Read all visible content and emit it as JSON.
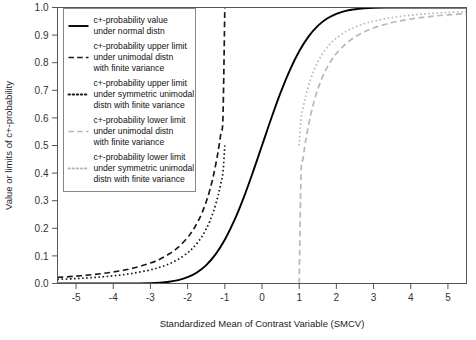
{
  "chart_data": {
    "type": "line",
    "title": "",
    "xlabel": "Standardized Mean of Contrast Variable (SMCV)",
    "ylabel": "Value or limits of c+-probability",
    "xlim": [
      -5.5,
      5.5
    ],
    "ylim": [
      0.0,
      1.0
    ],
    "grid": false,
    "legend_position": "top-left",
    "xticks": [
      "-5",
      "-4",
      "-3",
      "-2",
      "-1",
      "0",
      "1",
      "2",
      "3",
      "4",
      "5"
    ],
    "xtick_values": [
      -5,
      -4,
      -3,
      -2,
      -1,
      0,
      1,
      2,
      3,
      4,
      5
    ],
    "yticks": [
      "0.0",
      "0.1",
      "0.2",
      "0.3",
      "0.4",
      "0.5",
      "0.6",
      "0.7",
      "0.8",
      "0.9",
      "1.0"
    ],
    "ytick_values": [
      0.0,
      0.1,
      0.2,
      0.3,
      0.4,
      0.5,
      0.6,
      0.7,
      0.8,
      0.9,
      1.0
    ],
    "series": [
      {
        "name": "c+-probability value under normal distn",
        "style": "solid",
        "color": "#000000",
        "width": 1.9,
        "x": [
          -5.5,
          -5.0,
          -4.5,
          -4.0,
          -3.5,
          -3.0,
          -2.75,
          -2.5,
          -2.25,
          -2.0,
          -1.75,
          -1.5,
          -1.25,
          -1.0,
          -0.75,
          -0.5,
          -0.25,
          0.0,
          0.25,
          0.5,
          0.75,
          1.0,
          1.25,
          1.5,
          1.75,
          2.0,
          2.25,
          2.5,
          2.75,
          3.0,
          3.5,
          4.0,
          4.5,
          5.0,
          5.5
        ],
        "y": [
          0.0,
          0.0,
          0.0,
          0.0,
          0.0002,
          0.0013,
          0.003,
          0.0062,
          0.0122,
          0.0228,
          0.0401,
          0.0668,
          0.1056,
          0.1587,
          0.2266,
          0.3085,
          0.4013,
          0.5,
          0.5987,
          0.6915,
          0.7734,
          0.8413,
          0.8944,
          0.9332,
          0.9599,
          0.9772,
          0.9878,
          0.9938,
          0.997,
          0.9987,
          0.9998,
          1.0,
          1.0,
          1.0,
          1.0
        ]
      },
      {
        "name": "c+-probability upper limit under unimodal distn with finite variance",
        "style": "dashed",
        "color": "#1a1a1a",
        "width": 1.7,
        "x": [
          -5.5,
          -5.0,
          -4.5,
          -4.0,
          -3.5,
          -3.0,
          -2.75,
          -2.5,
          -2.25,
          -2.0,
          -1.9,
          -1.8,
          -1.7,
          -1.6,
          -1.5,
          -1.4,
          -1.3,
          -1.2,
          -1.15,
          -1.1,
          -1.05,
          -1.0
        ],
        "y": [
          0.022,
          0.0267,
          0.0329,
          0.0417,
          0.0544,
          0.0741,
          0.0882,
          0.1067,
          0.1317,
          0.1667,
          0.1847,
          0.2058,
          0.2307,
          0.2604,
          0.2963,
          0.3401,
          0.3945,
          0.463,
          0.5042,
          0.551,
          0.6042,
          1.0
        ]
      },
      {
        "name": "c+-probability upper limit under symmetric unimodal distn with finite variance",
        "style": "dotted",
        "color": "#1a1a1a",
        "width": 1.7,
        "x": [
          -5.5,
          -5.0,
          -4.5,
          -4.0,
          -3.5,
          -3.0,
          -2.75,
          -2.5,
          -2.25,
          -2.0,
          -1.9,
          -1.8,
          -1.7,
          -1.6,
          -1.5,
          -1.4,
          -1.3,
          -1.2,
          -1.15,
          -1.1,
          -1.05,
          -1.0
        ],
        "y": [
          0.0147,
          0.0178,
          0.022,
          0.0278,
          0.0363,
          0.0494,
          0.0588,
          0.0711,
          0.0878,
          0.1111,
          0.1231,
          0.1372,
          0.1538,
          0.1736,
          0.1975,
          0.2268,
          0.263,
          0.3086,
          0.3361,
          0.3673,
          0.4028,
          0.5
        ]
      },
      {
        "name": "c+-probability lower limit under unimodal distn with finite variance",
        "style": "dashed",
        "color": "#b8b8b8",
        "width": 1.7,
        "x": [
          1.0,
          1.05,
          1.1,
          1.15,
          1.2,
          1.3,
          1.4,
          1.5,
          1.6,
          1.7,
          1.8,
          1.9,
          2.0,
          2.25,
          2.5,
          2.75,
          3.0,
          3.5,
          4.0,
          4.5,
          5.0,
          5.5
        ],
        "y": [
          0.0,
          0.3958,
          0.449,
          0.4958,
          0.537,
          0.6055,
          0.6599,
          0.7037,
          0.7396,
          0.7693,
          0.7942,
          0.8153,
          0.8333,
          0.8683,
          0.8933,
          0.9118,
          0.9259,
          0.9456,
          0.9583,
          0.9671,
          0.9733,
          0.978
        ]
      },
      {
        "name": "c+-probability lower limit under symmetric unimodal distn with finite variance",
        "style": "dotted",
        "color": "#b8b8b8",
        "width": 1.7,
        "x": [
          1.0,
          1.05,
          1.1,
          1.15,
          1.2,
          1.3,
          1.4,
          1.5,
          1.6,
          1.7,
          1.8,
          1.9,
          2.0,
          2.25,
          2.5,
          2.75,
          3.0,
          3.5,
          4.0,
          4.5,
          5.0,
          5.5
        ],
        "y": [
          0.5,
          0.5972,
          0.6327,
          0.6639,
          0.6914,
          0.737,
          0.7732,
          0.8025,
          0.8264,
          0.8462,
          0.8628,
          0.8769,
          0.8889,
          0.9122,
          0.9289,
          0.9412,
          0.9506,
          0.9637,
          0.9722,
          0.978,
          0.9822,
          0.9853
        ]
      }
    ]
  },
  "legend": {
    "entries": [
      {
        "style": "solid",
        "lines": [
          "c+-probability value",
          "under normal distn"
        ]
      },
      {
        "style": "dashed",
        "lines": [
          "c+-probability upper limit",
          "under unimodal distn",
          "with finite variance"
        ]
      },
      {
        "style": "dotted",
        "lines": [
          "c+-probability upper limit",
          "under symmetric unimodal",
          "distn with finite variance"
        ]
      },
      {
        "style": "dashed-light",
        "lines": [
          "c+-probability lower limit",
          "under unimodal distn",
          "with finite variance"
        ]
      },
      {
        "style": "dotted-light",
        "lines": [
          "c+-probability lower limit",
          "under symmetric unimodal",
          "distn with finite variance"
        ]
      }
    ]
  },
  "colors": {
    "dark": "#000000",
    "light": "#b8b8b8",
    "frame": "#555555",
    "text": "#222222",
    "background": "#ffffff"
  }
}
